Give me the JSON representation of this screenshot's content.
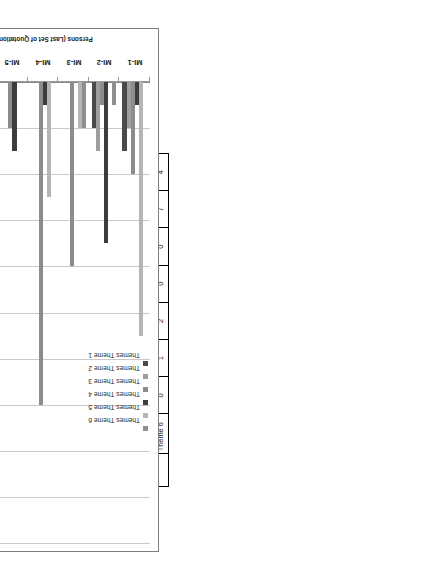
{
  "table": {
    "title": "Persons (Last Set of Quotations)",
    "themes_axis_label": "Themes",
    "row_header_blank": "",
    "persons": [
      "MI-1",
      "MI-2",
      "MI-3",
      "MI-4",
      "MI-5",
      "MI-6",
      "MI-7"
    ],
    "themes": [
      "Theme 1",
      "Theme 2",
      "Theme 3",
      "Theme 4",
      "Theme 5",
      "Theme 6"
    ],
    "rows": [
      {
        "theme": "Theme 1",
        "values": [
          3,
          2,
          0,
          0,
          0,
          0,
          13
        ]
      },
      {
        "theme": "Theme 2",
        "values": [
          2,
          3,
          0,
          0,
          0,
          3,
          0
        ]
      },
      {
        "theme": "Theme 3",
        "values": [
          4,
          1,
          8,
          14,
          2,
          18,
          14
        ]
      },
      {
        "theme": "Theme 4",
        "values": [
          1,
          7,
          0,
          1,
          3,
          2,
          1
        ]
      },
      {
        "theme": "Theme 5",
        "values": [
          11,
          0,
          2,
          5,
          0,
          3,
          0
        ]
      },
      {
        "theme": "Theme 6",
        "values": [
          0,
          1,
          2,
          0,
          0,
          7,
          4
        ]
      }
    ]
  },
  "chart_data": {
    "type": "bar",
    "orientation": "horizontal",
    "title": "",
    "xlabel": "Persons (Last Set of Quotations)",
    "ylabel": "",
    "categories": [
      "MI-1",
      "MI-2",
      "MI-3",
      "MI-4",
      "MI-5",
      "MI-6",
      "MI-7"
    ],
    "xlim": [
      0,
      20
    ],
    "ticks": [
      0,
      2,
      4,
      6,
      8,
      10,
      12,
      14,
      16,
      18,
      20
    ],
    "grid": true,
    "legend_position": "right",
    "series": [
      {
        "name": "Themes Theme 1",
        "color": "#4a4a4a",
        "values": [
          3,
          2,
          0,
          0,
          0,
          0,
          13
        ]
      },
      {
        "name": "Themes Theme 2",
        "color": "#9e9e9e",
        "values": [
          2,
          3,
          0,
          0,
          0,
          3,
          0
        ]
      },
      {
        "name": "Themes Theme 3",
        "color": "#8c8c8c",
        "values": [
          4,
          1,
          8,
          14,
          2,
          18,
          14
        ]
      },
      {
        "name": "Themes Theme 4",
        "color": "#3d3d3d",
        "values": [
          1,
          7,
          0,
          1,
          3,
          2,
          1
        ]
      },
      {
        "name": "Themes Theme 5",
        "color": "#b5b5b5",
        "values": [
          11,
          0,
          2,
          5,
          0,
          3,
          0
        ]
      },
      {
        "name": "Themes Theme 6",
        "color": "#8f8f8f",
        "values": [
          0,
          1,
          2,
          0,
          0,
          7,
          4
        ]
      }
    ]
  },
  "legend": {
    "items": [
      "Themes Theme 1",
      "Themes Theme 2",
      "Themes Theme 3",
      "Themes Theme 4",
      "Themes Theme 5",
      "Themes Theme 6"
    ]
  },
  "axis": {
    "value_ticks": [
      "0",
      "2",
      "4",
      "6",
      "8",
      "10",
      "12",
      "14",
      "16",
      "18",
      "20"
    ],
    "category_labels": [
      "MI-1",
      "MI-2",
      "MI-3",
      "MI-4",
      "MI-5",
      "MI-6",
      "MI-7"
    ],
    "title": "Persons (Last Set of Quotations)"
  }
}
